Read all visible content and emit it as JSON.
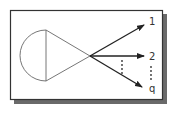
{
  "diagram": {
    "type": "network-junction",
    "outputs": [
      {
        "label": "1"
      },
      {
        "label": "2"
      },
      {
        "label": "q"
      }
    ],
    "ellipsis_between": [
      "2",
      "q"
    ],
    "colors": {
      "frame": "#333333",
      "shadow": "#555555",
      "lines": "#555555",
      "arrows": "#222222"
    }
  }
}
